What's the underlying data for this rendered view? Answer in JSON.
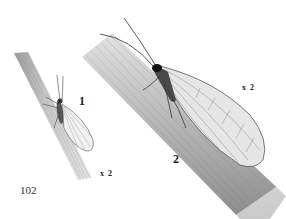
{
  "plate": {
    "page_number": "102",
    "figures": [
      {
        "number": "1",
        "magnification": "x 2",
        "subject": "small insect with rounded veined wings on narrow stem"
      },
      {
        "number": "2",
        "magnification": "x 2",
        "subject": "large insect with long veined wings and long antennae on wide stem"
      }
    ]
  },
  "colors": {
    "background": "#ffffff",
    "stem_light": "#d8d8d8",
    "stem_dark": "#8a8a8a",
    "ink": "#222222"
  }
}
